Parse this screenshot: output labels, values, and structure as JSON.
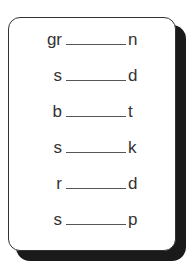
{
  "worksheet": {
    "rows": [
      {
        "start": "gr",
        "end": "n"
      },
      {
        "start": "s",
        "end": "d"
      },
      {
        "start": "b",
        "end": "t"
      },
      {
        "start": "s",
        "end": "k"
      },
      {
        "start": "r",
        "end": "d"
      },
      {
        "start": "s",
        "end": "p"
      }
    ]
  }
}
